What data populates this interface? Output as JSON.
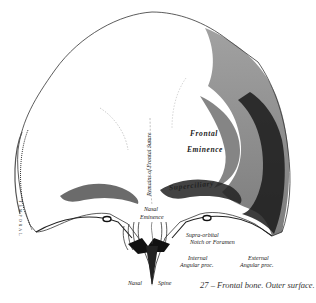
{
  "figure": {
    "number": "27",
    "caption": "27 – Frontal bone. Outer surface."
  },
  "labels": {
    "frontal": "Frontal",
    "eminence": "Eminence",
    "superciliary": "Superciliary",
    "suture": "Remains of Frontal Suture",
    "nasal_eminence_1": "Nasal",
    "nasal_eminence_2": "Eminence",
    "supraorbital_1": "Supra-orbital",
    "supraorbital_2": "Notch or Foramen",
    "internal_angular_1": "Internal",
    "internal_angular_2": "Angular proc.",
    "external_angular_1": "External",
    "external_angular_2": "Angular proc.",
    "nasal_spine_1": "Nasal",
    "nasal_spine_2": "Spine",
    "temporal": "TEMPORAL"
  },
  "colors": {
    "ink": "#1a1a1a",
    "shade_dark": "#2a2a2a",
    "shade_mid": "#7a7a7a",
    "shade_light": "#c4c4c4",
    "paper": "#ffffff"
  }
}
